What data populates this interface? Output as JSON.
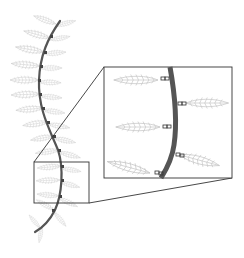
{
  "figure": {
    "colors": {
      "stem": "#555555",
      "leaflet": "#bdbdbd",
      "joint": "#444444",
      "frame": "#333333",
      "background": "#ffffff"
    },
    "detail_box": {
      "x": 34,
      "y": 162,
      "w": 55,
      "h": 41
    },
    "inset_box": {
      "x": 104,
      "y": 67,
      "w": 128,
      "h": 111
    }
  }
}
